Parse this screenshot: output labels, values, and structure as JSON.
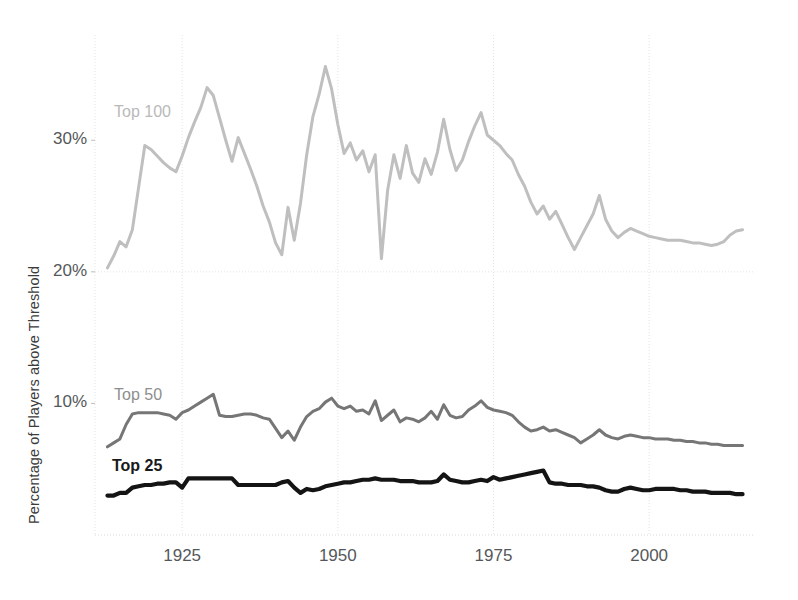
{
  "chart_data": {
    "type": "line",
    "title": "",
    "xlabel": "",
    "ylabel": "Percentage of Players above Threshold",
    "xlim": [
      1911,
      2017
    ],
    "ylim": [
      0,
      38
    ],
    "grid": true,
    "legend_position": "inline-labels",
    "y_ticks": [
      "10%",
      "20%",
      "30%"
    ],
    "y_tick_values": [
      10,
      20,
      30
    ],
    "x_ticks": [
      "1925",
      "1950",
      "1975",
      "2000"
    ],
    "x_tick_values": [
      1925,
      1950,
      1975,
      2000
    ],
    "x_gridlines": [
      1900,
      1925,
      1950,
      1975,
      2000
    ],
    "colors": {
      "top100": "#bfbfbf",
      "top50": "#767676",
      "top25": "#141414",
      "gridline": "#e4e4e4",
      "axis_text": "#55585a",
      "axis_title": "#3b3b3b"
    },
    "series": [
      {
        "name": "Top 100",
        "color": "#bfbfbf",
        "label_x": 1916,
        "label_y": 32.6,
        "x": [
          1913,
          1914,
          1915,
          1916,
          1917,
          1918,
          1919,
          1920,
          1921,
          1922,
          1923,
          1924,
          1925,
          1926,
          1927,
          1928,
          1929,
          1930,
          1931,
          1932,
          1933,
          1934,
          1935,
          1936,
          1937,
          1938,
          1939,
          1940,
          1941,
          1942,
          1943,
          1944,
          1945,
          1946,
          1947,
          1948,
          1949,
          1950,
          1951,
          1952,
          1953,
          1954,
          1955,
          1956,
          1957,
          1958,
          1959,
          1960,
          1961,
          1962,
          1963,
          1964,
          1965,
          1966,
          1967,
          1968,
          1969,
          1970,
          1971,
          1972,
          1973,
          1974,
          1975,
          1976,
          1977,
          1978,
          1979,
          1980,
          1981,
          1982,
          1983,
          1984,
          1985,
          1986,
          1987,
          1988,
          1989,
          1990,
          1991,
          1992,
          1993,
          1994,
          1995,
          1996,
          1997,
          1998,
          1999,
          2000,
          2001,
          2002,
          2003,
          2004,
          2005,
          2006,
          2007,
          2008,
          2009,
          2010,
          2011,
          2012,
          2013,
          2014,
          2015
        ],
        "values": [
          20.3,
          21.2,
          22.3,
          21.9,
          23.2,
          26.4,
          29.6,
          29.3,
          28.8,
          28.3,
          27.9,
          27.6,
          28.8,
          30.2,
          31.4,
          32.5,
          34.0,
          33.4,
          31.7,
          30.0,
          28.4,
          30.2,
          29.0,
          27.8,
          26.5,
          25.0,
          23.8,
          22.2,
          21.3,
          24.9,
          22.4,
          25.2,
          28.9,
          31.8,
          33.5,
          35.6,
          33.9,
          31.2,
          29.0,
          29.8,
          28.5,
          29.2,
          27.6,
          28.9,
          21.0,
          26.2,
          28.9,
          27.1,
          29.6,
          27.5,
          26.8,
          28.6,
          27.4,
          29.1,
          31.6,
          29.3,
          27.7,
          28.5,
          29.9,
          31.1,
          32.1,
          30.4,
          30.0,
          29.6,
          29.0,
          28.5,
          27.4,
          26.5,
          25.3,
          24.4,
          25.0,
          24.0,
          24.6,
          23.6,
          22.6,
          21.7,
          22.6,
          23.5,
          24.4,
          25.8,
          24.0,
          23.1,
          22.6,
          23.0,
          23.3,
          23.1,
          22.9,
          22.7,
          22.6,
          22.5,
          22.4,
          22.4,
          22.4,
          22.3,
          22.2,
          22.2,
          22.1,
          22.0,
          22.1,
          22.3,
          22.8,
          23.1,
          23.2
        ]
      },
      {
        "name": "Top 50",
        "color": "#767676",
        "label_x": 1916,
        "label_y": 11.9,
        "x": [
          1913,
          1914,
          1915,
          1916,
          1917,
          1918,
          1919,
          1920,
          1921,
          1922,
          1923,
          1924,
          1925,
          1926,
          1927,
          1928,
          1929,
          1930,
          1931,
          1932,
          1933,
          1934,
          1935,
          1936,
          1937,
          1938,
          1939,
          1940,
          1941,
          1942,
          1943,
          1944,
          1945,
          1946,
          1947,
          1948,
          1949,
          1950,
          1951,
          1952,
          1953,
          1954,
          1955,
          1956,
          1957,
          1958,
          1959,
          1960,
          1961,
          1962,
          1963,
          1964,
          1965,
          1966,
          1967,
          1968,
          1969,
          1970,
          1971,
          1972,
          1973,
          1974,
          1975,
          1976,
          1977,
          1978,
          1979,
          1980,
          1981,
          1982,
          1983,
          1984,
          1985,
          1986,
          1987,
          1988,
          1989,
          1990,
          1991,
          1992,
          1993,
          1994,
          1995,
          1996,
          1997,
          1998,
          1999,
          2000,
          2001,
          2002,
          2003,
          2004,
          2005,
          2006,
          2007,
          2008,
          2009,
          2010,
          2011,
          2012,
          2013,
          2014,
          2015
        ],
        "values": [
          6.7,
          7.0,
          7.3,
          8.4,
          9.2,
          9.3,
          9.3,
          9.3,
          9.3,
          9.2,
          9.1,
          8.8,
          9.3,
          9.5,
          9.8,
          10.1,
          10.4,
          10.7,
          9.1,
          9.0,
          9.0,
          9.1,
          9.2,
          9.2,
          9.1,
          8.9,
          8.8,
          8.1,
          7.4,
          7.9,
          7.2,
          8.2,
          9.0,
          9.4,
          9.6,
          10.1,
          10.4,
          9.8,
          9.6,
          9.8,
          9.4,
          9.5,
          9.2,
          10.2,
          8.7,
          9.1,
          9.5,
          8.6,
          8.9,
          8.8,
          8.6,
          8.9,
          9.4,
          8.8,
          9.9,
          9.1,
          8.9,
          9.0,
          9.5,
          9.8,
          10.2,
          9.7,
          9.5,
          9.4,
          9.3,
          9.1,
          8.6,
          8.2,
          7.9,
          8.0,
          8.2,
          7.9,
          8.0,
          7.8,
          7.6,
          7.4,
          7.0,
          7.3,
          7.6,
          8.0,
          7.6,
          7.4,
          7.3,
          7.5,
          7.6,
          7.5,
          7.4,
          7.4,
          7.3,
          7.3,
          7.3,
          7.2,
          7.2,
          7.1,
          7.1,
          7.0,
          7.0,
          6.9,
          6.9,
          6.8,
          6.8,
          6.8,
          6.8
        ]
      },
      {
        "name": "Top 25",
        "color": "#141414",
        "label_x": 1915,
        "label_y": 6.0,
        "x": [
          1913,
          1914,
          1915,
          1916,
          1917,
          1918,
          1919,
          1920,
          1921,
          1922,
          1923,
          1924,
          1925,
          1926,
          1927,
          1928,
          1929,
          1930,
          1931,
          1932,
          1933,
          1934,
          1935,
          1936,
          1937,
          1938,
          1939,
          1940,
          1941,
          1942,
          1943,
          1944,
          1945,
          1946,
          1947,
          1948,
          1949,
          1950,
          1951,
          1952,
          1953,
          1954,
          1955,
          1956,
          1957,
          1958,
          1959,
          1960,
          1961,
          1962,
          1963,
          1964,
          1965,
          1966,
          1967,
          1968,
          1969,
          1970,
          1971,
          1972,
          1973,
          1974,
          1975,
          1976,
          1977,
          1978,
          1979,
          1980,
          1981,
          1982,
          1983,
          1984,
          1985,
          1986,
          1987,
          1988,
          1989,
          1990,
          1991,
          1992,
          1993,
          1994,
          1995,
          1996,
          1997,
          1998,
          1999,
          2000,
          2001,
          2002,
          2003,
          2004,
          2005,
          2006,
          2007,
          2008,
          2009,
          2010,
          2011,
          2012,
          2013,
          2014,
          2015
        ],
        "values": [
          3.0,
          3.0,
          3.2,
          3.2,
          3.6,
          3.7,
          3.8,
          3.8,
          3.9,
          3.9,
          4.0,
          4.0,
          3.6,
          4.3,
          4.3,
          4.3,
          4.3,
          4.3,
          4.3,
          4.3,
          4.3,
          3.8,
          3.8,
          3.8,
          3.8,
          3.8,
          3.8,
          3.8,
          4.0,
          4.1,
          3.6,
          3.2,
          3.5,
          3.4,
          3.5,
          3.7,
          3.8,
          3.9,
          4.0,
          4.0,
          4.1,
          4.2,
          4.2,
          4.3,
          4.2,
          4.2,
          4.2,
          4.1,
          4.1,
          4.1,
          4.0,
          4.0,
          4.0,
          4.1,
          4.6,
          4.2,
          4.1,
          4.0,
          4.0,
          4.1,
          4.2,
          4.1,
          4.4,
          4.2,
          4.3,
          4.4,
          4.5,
          4.6,
          4.7,
          4.8,
          4.9,
          4.0,
          3.9,
          3.9,
          3.8,
          3.8,
          3.8,
          3.7,
          3.7,
          3.6,
          3.4,
          3.3,
          3.3,
          3.5,
          3.6,
          3.5,
          3.4,
          3.4,
          3.5,
          3.5,
          3.5,
          3.5,
          3.4,
          3.4,
          3.3,
          3.3,
          3.3,
          3.2,
          3.2,
          3.2,
          3.2,
          3.1,
          3.1
        ]
      }
    ]
  }
}
